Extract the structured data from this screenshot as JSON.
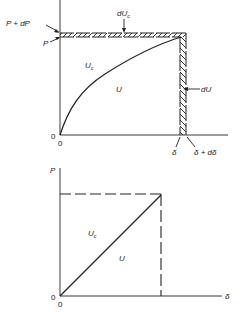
{
  "figures": [
    {
      "id": "top",
      "description": "Load-deflection curve (nonlinear) with strain energy U and complementary energy Uc, showing increments dUc and dU",
      "labels": {
        "p_plus_dp": "P + dP",
        "p": "P",
        "duc_main": "dU",
        "duc_sub": "c",
        "uc_main": "U",
        "uc_sub": "c",
        "u": "U",
        "du": "dU",
        "origin_y": "0",
        "origin_x": "0",
        "delta": "δ",
        "delta_plus_ddelta": "δ + dδ"
      }
    },
    {
      "id": "bottom",
      "description": "Linear load-deflection diagram where U equals Uc",
      "labels": {
        "p_axis": "P",
        "uc_main": "U",
        "uc_sub": "c",
        "u": "U",
        "origin_y": "0",
        "origin_x": "0",
        "delta_axis": "δ"
      }
    }
  ],
  "colors": {
    "line": "#222222",
    "background": "#ffffff"
  }
}
